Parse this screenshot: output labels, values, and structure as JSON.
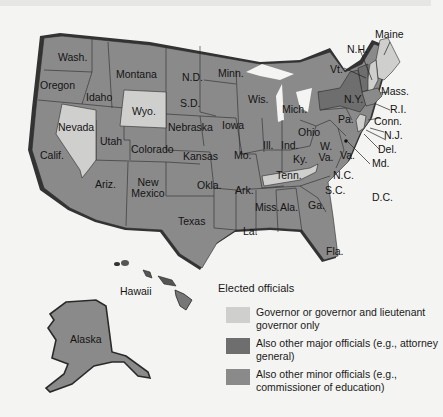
{
  "colors": {
    "governor_only": "#cfcfcd",
    "major_officials": "#6e6e6e",
    "minor_officials": "#8a8a8a",
    "shadow": "#333333",
    "background": "#f4f4f2"
  },
  "legend": {
    "title": "Elected officials",
    "items": [
      {
        "key": "governor_only",
        "label": "Governor or governor and lieutenant governor only",
        "color": "#cfcfcd"
      },
      {
        "key": "major_officials",
        "label": "Also other major officials (e.g., attorney general)",
        "color": "#6e6e6e"
      },
      {
        "key": "minor_officials",
        "label": "Also other minor officials (e.g., commissioner of education)",
        "color": "#8a8a8a"
      }
    ]
  },
  "states": {
    "wash": "Wash.",
    "oregon": "Oregon",
    "calif": "Calif.",
    "nevada": "Nevada",
    "idaho": "Idaho",
    "montana": "Montana",
    "wyo": "Wyo.",
    "utah": "Utah",
    "colorado": "Colorado",
    "ariz": "Ariz.",
    "new_mexico": "New\nMexico",
    "nd": "N.D.",
    "sd": "S.D.",
    "nebraska": "Nebraska",
    "kansas": "Kansas",
    "okla": "Okla.",
    "texas": "Texas",
    "minn": "Minn.",
    "iowa": "Iowa",
    "mo": "Mo.",
    "ark": "Ark.",
    "la": "La.",
    "wis": "Wis.",
    "ill": "Ill.",
    "mich": "Mich.",
    "ind": "Ind.",
    "ohio": "Ohio",
    "ky": "Ky.",
    "tenn": "Tenn.",
    "miss": "Miss.",
    "ala": "Ala.",
    "ga": "Ga.",
    "fla": "Fla.",
    "sc": "S.C.",
    "nc": "N.C.",
    "va": "Va.",
    "wva": "W.\nVa.",
    "pa": "Pa.",
    "ny": "N.Y.",
    "vt": "Vt.",
    "nh": "N.H.",
    "maine": "Maine",
    "mass": "Mass.",
    "ri": "R.I.",
    "conn": "Conn.",
    "nj": "N.J.",
    "del": "Del.",
    "md": "Md.",
    "dc": "D.C.",
    "hawaii": "Hawaii",
    "alaska": "Alaska"
  },
  "state_categories": {
    "governor_only": [
      "Nevada",
      "Wyo.",
      "Tenn.",
      "Maine",
      "N.H.",
      "N.J."
    ],
    "major_officials": [
      "Vt.",
      "N.Y."
    ]
  }
}
